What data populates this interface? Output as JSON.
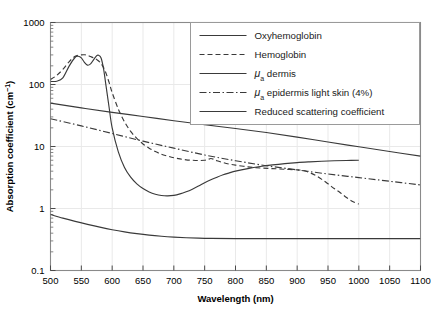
{
  "chart_data": {
    "type": "line",
    "title": "",
    "xlabel": "Wavelength (nm)",
    "ylabel": "Absorption coefficient (cm⁻¹)",
    "xlim": [
      500,
      1100
    ],
    "ylim": [
      0.1,
      1000
    ],
    "yscale": "log",
    "xscale": "linear",
    "grid": true,
    "legend_position": "top-right",
    "xticks": [
      500,
      550,
      600,
      650,
      700,
      750,
      800,
      850,
      900,
      950,
      1000,
      1050,
      1100
    ],
    "xtick_labels": [
      "500",
      "550",
      "600",
      "650",
      "700",
      "750",
      "800",
      "850",
      "900",
      "950",
      "1000",
      "1050",
      "1100"
    ],
    "yticks": [
      0.1,
      1,
      10,
      100,
      1000
    ],
    "ytick_labels": [
      "0.1",
      "1",
      "10",
      "100",
      "1000"
    ],
    "series": [
      {
        "name": "Oxyhemoglobin",
        "style": "solid",
        "color": "#3a3a3a",
        "x": [
          500,
          510,
          520,
          530,
          540,
          545,
          550,
          555,
          560,
          565,
          570,
          575,
          578,
          582,
          586,
          590,
          595,
          600,
          610,
          620,
          630,
          640,
          650,
          660,
          670,
          680,
          690,
          700,
          710,
          720,
          730,
          740,
          750,
          760,
          770,
          780,
          790,
          800,
          820,
          840,
          860,
          880,
          900,
          920,
          940,
          960,
          980,
          1000
        ],
        "y": [
          112,
          113,
          128,
          196,
          275,
          285,
          268,
          228,
          205,
          215,
          252,
          292,
          296,
          268,
          180,
          96,
          43,
          20,
          8.2,
          4.6,
          3.2,
          2.5,
          2.1,
          1.85,
          1.7,
          1.62,
          1.6,
          1.63,
          1.72,
          1.86,
          2.05,
          2.3,
          2.6,
          2.9,
          3.2,
          3.5,
          3.75,
          4.0,
          4.4,
          4.75,
          5.05,
          5.3,
          5.5,
          5.65,
          5.78,
          5.88,
          5.95,
          6.0
        ]
      },
      {
        "name": "Hemoglobin",
        "style": "dashed",
        "color": "#3a3a3a",
        "x": [
          500,
          510,
          520,
          530,
          540,
          550,
          555,
          560,
          565,
          570,
          575,
          580,
          585,
          590,
          595,
          600,
          610,
          620,
          630,
          640,
          650,
          660,
          670,
          680,
          690,
          700,
          710,
          720,
          730,
          740,
          750,
          755,
          760,
          765,
          770,
          780,
          790,
          800,
          820,
          840,
          860,
          880,
          900,
          910,
          920,
          930,
          940,
          950,
          960,
          970,
          980,
          990,
          1000
        ],
        "y": [
          120,
          140,
          175,
          232,
          285,
          300,
          302,
          296,
          282,
          268,
          252,
          230,
          196,
          152,
          108,
          74,
          40,
          25,
          17.5,
          13.5,
          11.0,
          9.4,
          8.3,
          7.5,
          7.0,
          6.6,
          6.3,
          6.1,
          6.0,
          5.95,
          6.0,
          6.15,
          6.4,
          6.2,
          5.9,
          5.5,
          5.2,
          5.0,
          4.7,
          4.5,
          4.4,
          4.3,
          4.2,
          4.1,
          3.8,
          3.4,
          2.95,
          2.5,
          2.1,
          1.8,
          1.5,
          1.3,
          1.18
        ]
      },
      {
        "name": "μ_a dermis",
        "legend_prefix": "μ",
        "legend_sub": "a",
        "legend_rest": " dermis",
        "style": "solid",
        "color": "#3a3a3a",
        "x": [
          500,
          550,
          600,
          650,
          700,
          750,
          800,
          850,
          900,
          950,
          1000,
          1050,
          1100
        ],
        "y": [
          50,
          42,
          35.5,
          30.5,
          26.0,
          22.5,
          19.5,
          16.8,
          14.2,
          11.8,
          9.9,
          8.3,
          7.0
        ]
      },
      {
        "name": "μ_a epidermis light skin (4%)",
        "legend_prefix": "μ",
        "legend_sub": "a",
        "legend_rest": " epidermis light skin (4%)",
        "style": "dashdot",
        "color": "#3a3a3a",
        "x": [
          500,
          550,
          600,
          650,
          700,
          750,
          800,
          850,
          900,
          950,
          1000,
          1050,
          1100
        ],
        "y": [
          28,
          21.5,
          16.2,
          12.2,
          9.4,
          7.3,
          5.9,
          4.9,
          4.2,
          3.6,
          3.15,
          2.75,
          2.4
        ]
      },
      {
        "name": "Reduced scattering coefficient",
        "style": "solid",
        "color": "#3a3a3a",
        "x": [
          500,
          520,
          540,
          560,
          580,
          600,
          620,
          640,
          660,
          680,
          700,
          720,
          740,
          760,
          800,
          850,
          900,
          950,
          1000,
          1050,
          1100
        ],
        "y": [
          0.8,
          0.7,
          0.62,
          0.555,
          0.5,
          0.455,
          0.42,
          0.393,
          0.372,
          0.357,
          0.346,
          0.338,
          0.333,
          0.33,
          0.327,
          0.326,
          0.326,
          0.326,
          0.326,
          0.326,
          0.326
        ]
      }
    ]
  },
  "legend": {
    "items": [
      {
        "label": "Oxyhemoglobin",
        "style": "solid"
      },
      {
        "label": "Hemoglobin",
        "style": "dashed"
      },
      {
        "label": "dermis",
        "style": "solid",
        "mu": "μ",
        "sub": "a"
      },
      {
        "label": "epidermis light skin (4%)",
        "style": "dashdot",
        "mu": "μ",
        "sub": "a"
      },
      {
        "label": "Reduced scattering coefficient",
        "style": "solid"
      }
    ]
  },
  "axes": {
    "x_title": "Wavelength (nm)",
    "y_title_main": "Absorption coefficient (cm",
    "y_title_sup": "−1",
    "y_title_end": ")"
  }
}
